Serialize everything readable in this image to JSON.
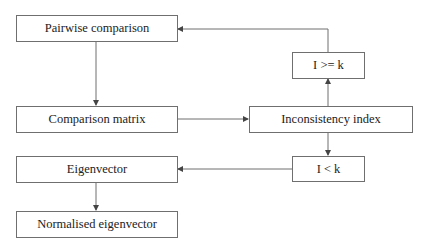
{
  "diagram": {
    "nodes": [
      {
        "id": "pairwise",
        "label": "Pairwise comparison"
      },
      {
        "id": "matrix",
        "label": "Comparison matrix"
      },
      {
        "id": "eigenvector",
        "label": "Eigenvector"
      },
      {
        "id": "normalised",
        "label": "Normalised eigenvector"
      },
      {
        "id": "ige",
        "label": "I >= k"
      },
      {
        "id": "inconsistency",
        "label": "Inconsistency index"
      },
      {
        "id": "ilt",
        "label": "I < k"
      }
    ],
    "edges": [
      {
        "from": "pairwise",
        "to": "matrix"
      },
      {
        "from": "matrix",
        "to": "inconsistency"
      },
      {
        "from": "inconsistency",
        "to": "ige"
      },
      {
        "from": "ige",
        "to": "pairwise"
      },
      {
        "from": "inconsistency",
        "to": "ilt"
      },
      {
        "from": "ilt",
        "to": "eigenvector"
      },
      {
        "from": "eigenvector",
        "to": "normalised"
      }
    ],
    "colors": {
      "line": "#6f6f6f",
      "text": "#222222"
    }
  }
}
